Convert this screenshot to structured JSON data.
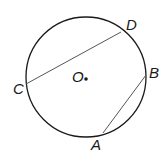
{
  "diagram": {
    "type": "circle-with-chords",
    "circle": {
      "center_label": "O",
      "cx": 86,
      "cy": 77,
      "r": 60
    },
    "points": [
      {
        "label": "D",
        "x": 121,
        "y": 32,
        "lx": 126,
        "ly": 30
      },
      {
        "label": "C",
        "x": 26,
        "y": 84,
        "lx": 13,
        "ly": 94
      },
      {
        "label": "B",
        "x": 146,
        "y": 75,
        "lx": 149,
        "ly": 78
      },
      {
        "label": "A",
        "x": 103,
        "y": 133,
        "lx": 91,
        "ly": 150
      }
    ],
    "chords": [
      {
        "from": "C",
        "to": "D"
      },
      {
        "from": "A",
        "to": "B"
      }
    ],
    "colors": {
      "circle": "#1a1a1a",
      "chord": "#555555",
      "text": "#1a1a1a"
    }
  }
}
